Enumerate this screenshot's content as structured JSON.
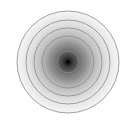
{
  "figure": {
    "center": [
      68,
      62
    ],
    "outer_radius": 51,
    "ring_radii": [
      51,
      42,
      34,
      26,
      18,
      11
    ],
    "ring_color": "#8a8a8a",
    "center_color": "#111111",
    "edge_color": "#f4f4f4",
    "background": "#ffffff"
  }
}
